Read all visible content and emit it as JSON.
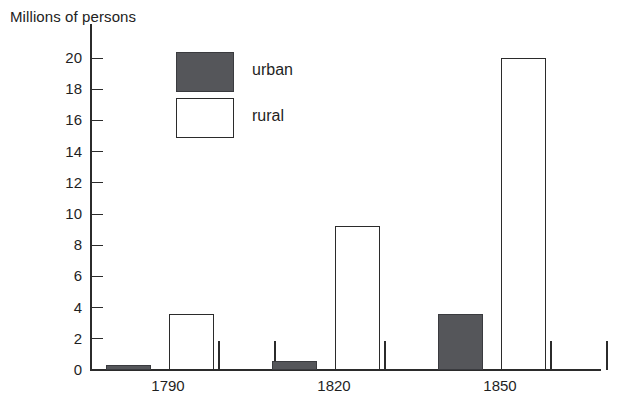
{
  "chart_data": {
    "type": "bar",
    "title": "Millions of persons",
    "xlabel": "",
    "ylabel": "Millions of persons",
    "categories": [
      "1790",
      "1820",
      "1850"
    ],
    "series": [
      {
        "name": "urban",
        "color": "#55565a",
        "values": [
          0.3,
          0.6,
          3.6
        ]
      },
      {
        "name": "rural",
        "color": "#ffffff",
        "values": [
          3.6,
          9.2,
          20.0
        ]
      }
    ],
    "ylim": [
      0,
      20
    ],
    "ytick_values": [
      0,
      2,
      4,
      6,
      8,
      10,
      12,
      14,
      16,
      18,
      20
    ],
    "ytick_labels": [
      "0",
      "2",
      "4",
      "6",
      "8",
      "10",
      "12",
      "14",
      "16",
      "18",
      "20"
    ],
    "grid": false,
    "legend_position": "upper-center",
    "legend": [
      {
        "key": "urban",
        "label": "urban",
        "swatch": "filled-dark-gray"
      },
      {
        "key": "rural",
        "label": "rural",
        "swatch": "open-white"
      }
    ]
  },
  "axis": {
    "y_title": "Millions of persons"
  },
  "colors": {
    "urban_fill": "#55565a",
    "rural_fill": "#ffffff",
    "axis": "#2b2b2b",
    "text": "#1f1f1f",
    "background": "#ffffff"
  }
}
